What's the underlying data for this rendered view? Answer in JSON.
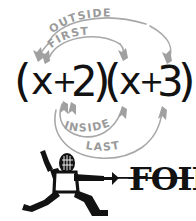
{
  "image": {
    "title": "FOIL method diagram",
    "background_color": "#ffffff",
    "ink_color": "#111111",
    "arc_color": "#a3a3a3"
  },
  "expression": {
    "full": "(x+2)(x+3)",
    "left_factor": {
      "open_paren": "(",
      "variable": "x",
      "operator": "+",
      "constant": "2",
      "close_paren": ")"
    },
    "right_factor": {
      "open_paren": "(",
      "variable": "x",
      "operator": "+",
      "constant": "3",
      "close_paren": ")"
    }
  },
  "foil_steps": [
    {
      "key": "F",
      "label": "FIRST",
      "position": "above-inner",
      "from": "left-x",
      "to": "right-x",
      "color": "#a3a3a3"
    },
    {
      "key": "O",
      "label": "OUTSIDE",
      "position": "above-outer",
      "from": "left-x",
      "to": "right-constant-3",
      "color": "#a3a3a3"
    },
    {
      "key": "I",
      "label": "INSIDE",
      "position": "below-inner",
      "from": "left-constant-2",
      "to": "right-x",
      "color": "#a3a3a3"
    },
    {
      "key": "L",
      "label": "LAST",
      "position": "below-outer",
      "from": "left-constant-2",
      "to": "right-constant-3",
      "color": "#a3a3a3"
    }
  ],
  "mnemonic": {
    "word": "FOIL",
    "style": "bold-rough-serif",
    "struck_through_by": "foil-blade"
  },
  "fencer": {
    "description": "fencer in lunge",
    "mask": "fencing-mask",
    "weapon": "foil",
    "torso_fill": "#ffffff",
    "silhouette_color": "#111111"
  }
}
